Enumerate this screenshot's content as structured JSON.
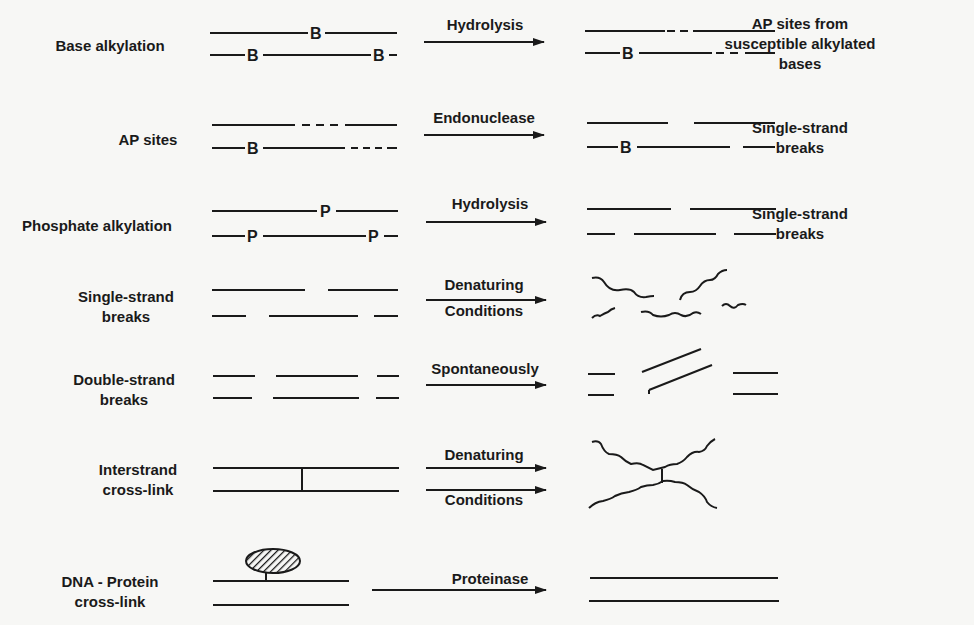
{
  "diagram": {
    "rows": [
      {
        "id": "base-alkylation",
        "lesion": "Base alkylation",
        "treatment": "Hydrolysis",
        "result": "AP sites from susceptible alkylated bases",
        "result_lines": [
          "AP sites from",
          "susceptible alkylated",
          "bases"
        ]
      },
      {
        "id": "ap-sites",
        "lesion": "AP sites",
        "treatment": "Endonuclease",
        "result": "Single-strand breaks",
        "result_lines": [
          "Single-strand",
          "breaks"
        ]
      },
      {
        "id": "phosphate-alkylation",
        "lesion": "Phosphate alkylation",
        "treatment": "Hydrolysis",
        "result": "Single-strand breaks",
        "result_lines": [
          "Single-strand",
          "breaks"
        ]
      },
      {
        "id": "single-strand-breaks",
        "lesion": "Single-strand breaks",
        "lesion_lines": [
          "Single-strand",
          "breaks"
        ],
        "treatment": "Denaturing Conditions",
        "treatment_lines": [
          "Denaturing",
          "Conditions"
        ],
        "result": ""
      },
      {
        "id": "double-strand-breaks",
        "lesion": "Double-strand breaks",
        "lesion_lines": [
          "Double-strand",
          "breaks"
        ],
        "treatment": "Spontaneously",
        "result": ""
      },
      {
        "id": "interstrand-cross-link",
        "lesion": "Interstrand cross-link",
        "lesion_lines": [
          "Interstrand",
          "cross-link"
        ],
        "treatment": "Denaturing Conditions",
        "treatment_lines": [
          "Denaturing",
          "Conditions"
        ],
        "result": ""
      },
      {
        "id": "dna-protein-cross-link",
        "lesion": "DNA - Protein cross-link",
        "lesion_lines": [
          "DNA - Protein",
          "cross-link"
        ],
        "treatment": "Proteinase",
        "result": ""
      }
    ],
    "markers": {
      "base": "B",
      "phosphate": "P"
    }
  }
}
